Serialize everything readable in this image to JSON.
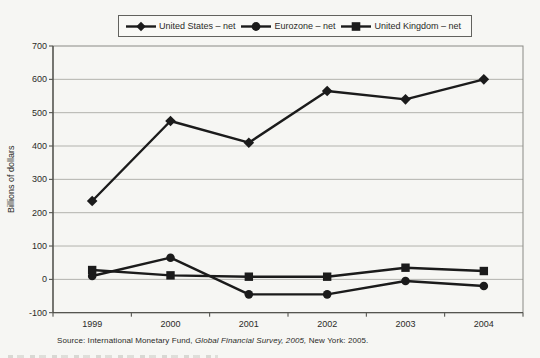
{
  "chart_data": {
    "type": "line",
    "x": [
      "1999",
      "2000",
      "2001",
      "2002",
      "2003",
      "2004"
    ],
    "series": [
      {
        "name": "United States – net",
        "marker": "diamond",
        "values": [
          235,
          475,
          410,
          565,
          540,
          600
        ]
      },
      {
        "name": "Eurozone – net",
        "marker": "circle",
        "values": [
          10,
          65,
          -45,
          -45,
          -5,
          -20
        ]
      },
      {
        "name": "United Kingdom – net",
        "marker": "square",
        "values": [
          28,
          12,
          8,
          8,
          35,
          25
        ]
      }
    ],
    "title": "",
    "xlabel": "",
    "ylabel": "Billions of dollars",
    "ylim": [
      -100,
      700
    ],
    "ytick_step": 100,
    "grid": true,
    "legend_position": "top",
    "colors": {
      "series": "#1b1b1b",
      "grid": "#b2b2ad",
      "border": "#8a8a85",
      "axis": "#44443f",
      "text": "#2b2b28"
    }
  },
  "source": {
    "prefix": "Source: International Monetary Fund, ",
    "italic": "Global Financial Survey, 2005,",
    "suffix": " New York: 2005."
  }
}
